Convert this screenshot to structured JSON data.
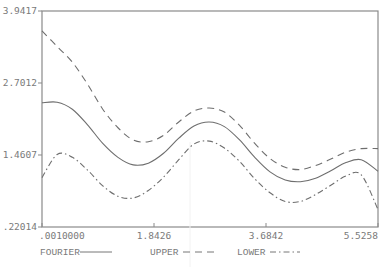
{
  "chart_data": {
    "type": "line",
    "title": "",
    "xlabel": "",
    "ylabel": "",
    "xlim": [
      0.001,
      5.5258
    ],
    "ylim": [
      0.22014,
      3.9417
    ],
    "x_ticks": [
      0.001,
      1.8426,
      3.6842,
      5.5258
    ],
    "x_tick_labels": [
      ".0010000",
      "1.8426",
      "3.6842",
      "5.5258"
    ],
    "y_ticks": [
      0.22014,
      1.4607,
      2.7012,
      3.9417
    ],
    "y_tick_labels": [
      ".22014",
      "1.4607",
      "2.7012",
      "3.9417"
    ],
    "grid": false,
    "legend_position": "bottom",
    "x": [
      0.001,
      0.25,
      0.5,
      0.75,
      1.0,
      1.25,
      1.5,
      1.75,
      2.0,
      2.25,
      2.5,
      2.75,
      3.0,
      3.25,
      3.5,
      3.75,
      4.0,
      4.25,
      4.5,
      4.75,
      5.0,
      5.25,
      5.5258
    ],
    "series": [
      {
        "name": "FOURIER",
        "style": "solid",
        "values": [
          2.36,
          2.37,
          2.25,
          1.98,
          1.66,
          1.42,
          1.29,
          1.32,
          1.49,
          1.75,
          1.96,
          2.03,
          1.95,
          1.72,
          1.42,
          1.17,
          1.03,
          1.0,
          1.06,
          1.19,
          1.33,
          1.38,
          1.18
        ]
      },
      {
        "name": "UPPER",
        "style": "dashed",
        "values": [
          3.6,
          3.33,
          3.06,
          2.68,
          2.25,
          1.93,
          1.72,
          1.69,
          1.8,
          2.03,
          2.22,
          2.27,
          2.2,
          1.97,
          1.66,
          1.4,
          1.25,
          1.21,
          1.28,
          1.39,
          1.51,
          1.57,
          1.57
        ]
      },
      {
        "name": "LOWER",
        "style": "dash-dot",
        "values": [
          1.07,
          1.47,
          1.42,
          1.2,
          0.93,
          0.75,
          0.72,
          0.85,
          1.08,
          1.38,
          1.65,
          1.7,
          1.58,
          1.35,
          1.05,
          0.81,
          0.66,
          0.66,
          0.78,
          0.94,
          1.1,
          1.12,
          0.52
        ]
      }
    ]
  }
}
